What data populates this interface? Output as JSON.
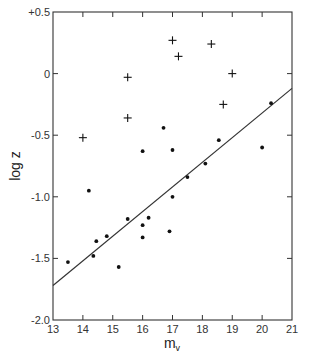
{
  "chart_data": {
    "type": "scatter",
    "title": "",
    "xlabel": "m_v",
    "xlabel_main": "m",
    "xlabel_sub": "v",
    "ylabel": "log z",
    "xlim": [
      13,
      21
    ],
    "ylim": [
      -2.0,
      0.5
    ],
    "grid": false,
    "legend": null,
    "x_ticks": [
      13,
      14,
      15,
      16,
      17,
      18,
      19,
      20,
      21
    ],
    "x_tick_labels": [
      "13",
      "14",
      "15",
      "16",
      "17",
      "18",
      "19",
      "20",
      "21"
    ],
    "y_ticks": [
      0.5,
      0,
      -0.5,
      -1.0,
      -1.5,
      -2.0
    ],
    "y_tick_labels": [
      "+0.5",
      "0",
      "-0.5",
      "-1.0",
      "-1.5",
      "-2.0"
    ],
    "series": [
      {
        "name": "dots",
        "marker": "circle",
        "points": [
          {
            "x": 13.5,
            "y": -1.53
          },
          {
            "x": 14.2,
            "y": -0.95
          },
          {
            "x": 14.35,
            "y": -1.48
          },
          {
            "x": 14.45,
            "y": -1.36
          },
          {
            "x": 14.8,
            "y": -1.32
          },
          {
            "x": 15.2,
            "y": -1.57
          },
          {
            "x": 15.5,
            "y": -1.18
          },
          {
            "x": 16.0,
            "y": -0.63
          },
          {
            "x": 16.0,
            "y": -1.23
          },
          {
            "x": 16.0,
            "y": -1.33
          },
          {
            "x": 16.2,
            "y": -1.17
          },
          {
            "x": 16.7,
            "y": -0.44
          },
          {
            "x": 16.9,
            "y": -1.28
          },
          {
            "x": 17.0,
            "y": -0.62
          },
          {
            "x": 17.0,
            "y": -1.0
          },
          {
            "x": 17.5,
            "y": -0.84
          },
          {
            "x": 18.1,
            "y": -0.73
          },
          {
            "x": 18.55,
            "y": -0.54
          },
          {
            "x": 20.0,
            "y": -0.6
          },
          {
            "x": 20.3,
            "y": -0.24
          }
        ]
      },
      {
        "name": "crosses",
        "marker": "plus",
        "points": [
          {
            "x": 14.0,
            "y": -0.52
          },
          {
            "x": 15.5,
            "y": -0.03
          },
          {
            "x": 15.5,
            "y": -0.36
          },
          {
            "x": 17.0,
            "y": 0.27
          },
          {
            "x": 17.2,
            "y": 0.14
          },
          {
            "x": 18.3,
            "y": 0.24
          },
          {
            "x": 18.7,
            "y": -0.25
          },
          {
            "x": 19.0,
            "y": 0.0
          }
        ]
      }
    ],
    "fit_line": {
      "x": [
        13,
        21
      ],
      "y": [
        -1.72,
        -0.12
      ],
      "slope": 0.2
    }
  },
  "layout": {
    "plot_left": 53,
    "plot_right": 292,
    "plot_top": 12,
    "plot_bottom": 320,
    "line_color": "#333333",
    "marker_color": "#111111"
  }
}
